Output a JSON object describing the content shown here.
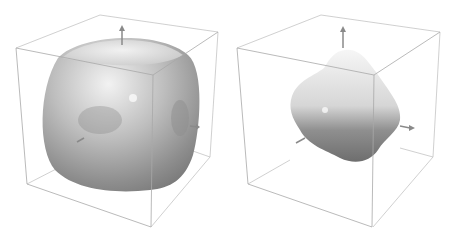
{
  "figure": {
    "panels": [
      {
        "id": "left",
        "description": "Cube-like rounded surface inside bounding box with axis arrows",
        "shape": "rounded-cube"
      },
      {
        "id": "right",
        "description": "Octahedral-like lobed surface inside bounding box with axis arrows",
        "shape": "lobed-octahedron"
      }
    ],
    "colors": {
      "box_line": "#b8b8b8",
      "surface_light": "#f0f0f0",
      "surface_mid": "#b4b4b4",
      "surface_dark": "#7a7a7a",
      "axis_arrow": "#8a8a8a",
      "background": "#ffffff"
    }
  }
}
